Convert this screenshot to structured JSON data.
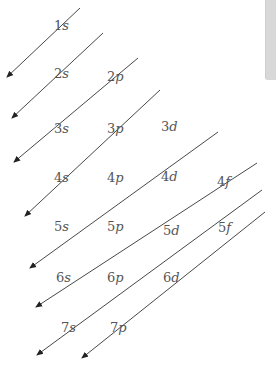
{
  "diagram": {
    "arrow_color": "#333333",
    "label_color": "#555555",
    "arrows": [
      {
        "x1": 80,
        "y1": 8,
        "x2": 7,
        "y2": 77
      },
      {
        "x1": 103,
        "y1": 33,
        "x2": 12,
        "y2": 118
      },
      {
        "x1": 138,
        "y1": 58,
        "x2": 14,
        "y2": 162
      },
      {
        "x1": 160,
        "y1": 90,
        "x2": 25,
        "y2": 216
      },
      {
        "x1": 218,
        "y1": 132,
        "x2": 30,
        "y2": 268
      },
      {
        "x1": 257,
        "y1": 163,
        "x2": 36,
        "y2": 307
      },
      {
        "x1": 262,
        "y1": 190,
        "x2": 37,
        "y2": 355
      },
      {
        "x1": 265,
        "y1": 212,
        "x2": 82,
        "y2": 358
      }
    ],
    "orbitals": [
      {
        "n": "1",
        "l": "s",
        "x": 54,
        "y": 30
      },
      {
        "n": "2",
        "l": "s",
        "x": 54,
        "y": 78
      },
      {
        "n": "2",
        "l": "p",
        "x": 107,
        "y": 81
      },
      {
        "n": "3",
        "l": "s",
        "x": 54,
        "y": 133
      },
      {
        "n": "3",
        "l": "p",
        "x": 107,
        "y": 133
      },
      {
        "n": "3",
        "l": "d",
        "x": 161,
        "y": 131
      },
      {
        "n": "4",
        "l": "s",
        "x": 54,
        "y": 182
      },
      {
        "n": "4",
        "l": "p",
        "x": 107,
        "y": 182
      },
      {
        "n": "4",
        "l": "d",
        "x": 161,
        "y": 181
      },
      {
        "n": "4",
        "l": "f",
        "x": 217,
        "y": 186
      },
      {
        "n": "5",
        "l": "s",
        "x": 54,
        "y": 231
      },
      {
        "n": "5",
        "l": "p",
        "x": 107,
        "y": 231
      },
      {
        "n": "5",
        "l": "d",
        "x": 163,
        "y": 235
      },
      {
        "n": "5",
        "l": "f",
        "x": 218,
        "y": 232
      },
      {
        "n": "6",
        "l": "s",
        "x": 56,
        "y": 282
      },
      {
        "n": "6",
        "l": "p",
        "x": 107,
        "y": 282
      },
      {
        "n": "6",
        "l": "d",
        "x": 163,
        "y": 282
      },
      {
        "n": "7",
        "l": "s",
        "x": 61,
        "y": 332
      },
      {
        "n": "7",
        "l": "p",
        "x": 110,
        "y": 332
      }
    ]
  },
  "sidebar_tab": {
    "visible": true
  }
}
